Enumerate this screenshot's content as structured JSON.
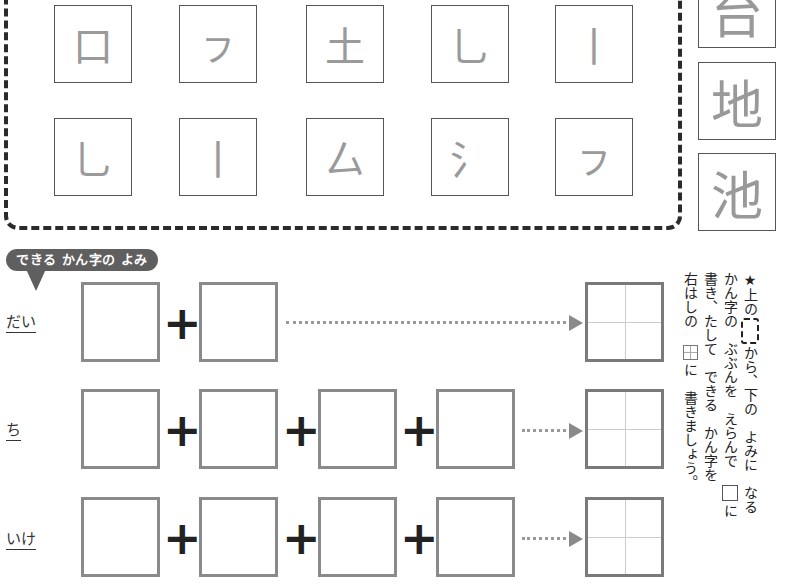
{
  "parts_panel": {
    "parts": [
      "口",
      "ㇷ",
      "土",
      "乚",
      "丨",
      "乚",
      "丨",
      "厶",
      "氵",
      "ㇷ"
    ]
  },
  "partial_kanji": [
    "台",
    "地",
    "池"
  ],
  "section": {
    "banner": "できる かん字の よみ"
  },
  "rows": [
    {
      "reading": "だい",
      "box_count": 2
    },
    {
      "reading": "ち",
      "box_count": 4
    },
    {
      "reading": "いけ",
      "box_count": 4
    }
  ],
  "operator": "+",
  "instructions": {
    "star": "★",
    "line1a": "上の",
    "line1b": "から、下の　よみに　なる",
    "line2a": "かん字の　ぶぶんを　えらんで",
    "line2b": "に",
    "line3": "書き、たして　できる　かん字を",
    "line4a": "右はしの",
    "line4b": "に　書きましょう。",
    "ruby_ue": "うえ",
    "ruby_shita": "した",
    "ruby_ka": "か",
    "ruby_migi": "みぎ"
  }
}
